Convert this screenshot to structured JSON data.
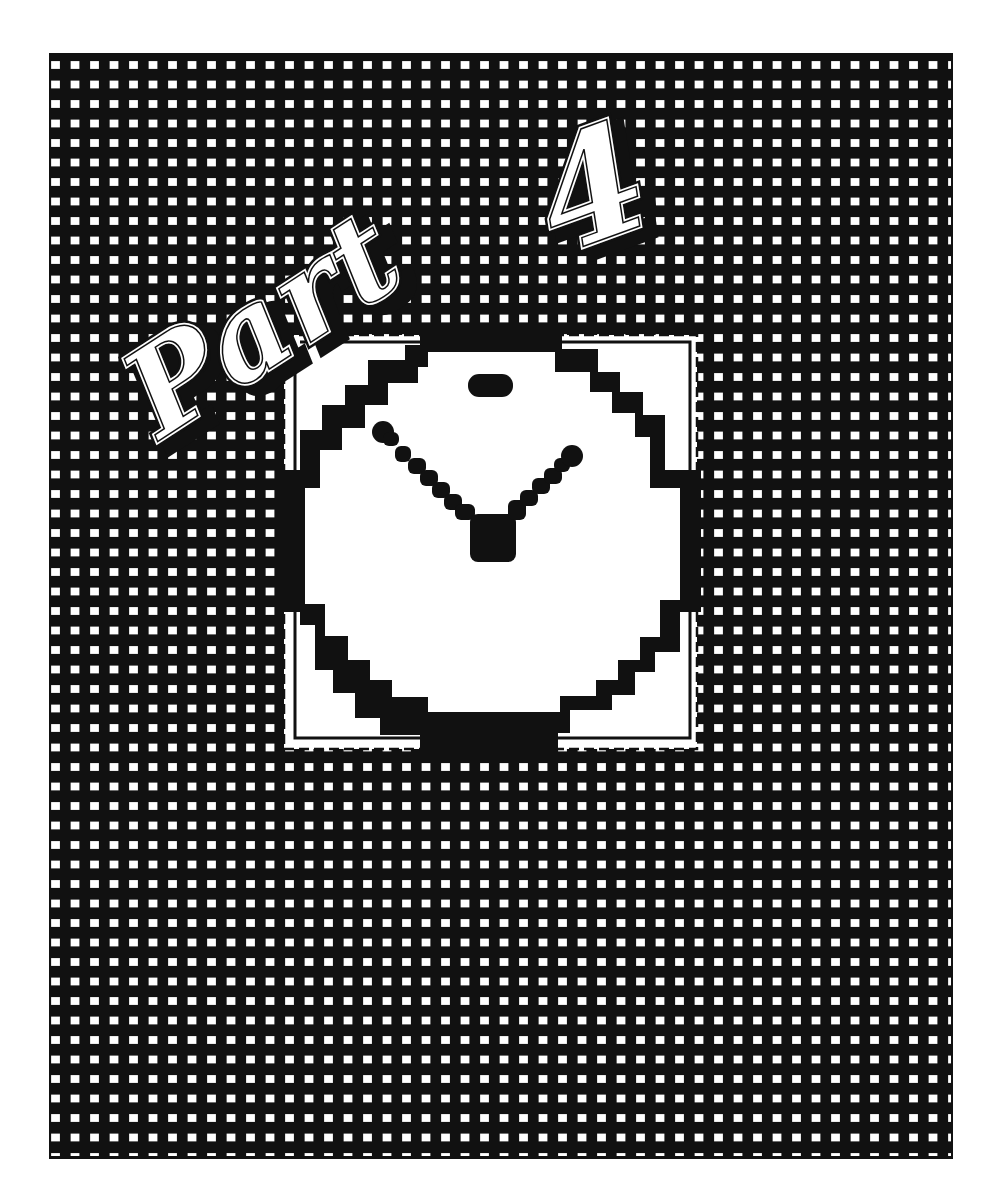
{
  "page": {
    "title": "Part 4",
    "background_color": "#ffffff",
    "ink_color": "#111111",
    "pattern": "dashed-grid"
  },
  "title_art": {
    "text": "Part 4",
    "word": "Part",
    "numeral": "4",
    "style": "outlined-script-with-drop-shadow"
  },
  "illustration": {
    "icon": "clock-icon",
    "style": "pixelated-clock-with-shadow",
    "hands": "v-shape",
    "inner_panel": "white-square"
  }
}
